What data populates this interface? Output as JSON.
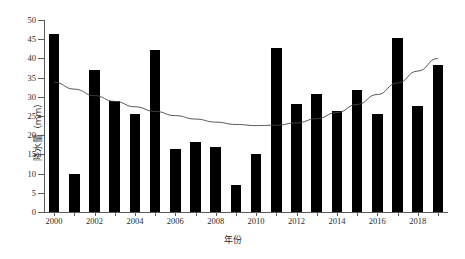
{
  "chart_data": {
    "type": "bar",
    "title": "",
    "xlabel": "年份",
    "ylabel": "降水量（mm）",
    "categories": [
      2000,
      2001,
      2002,
      2003,
      2004,
      2005,
      2006,
      2007,
      2008,
      2009,
      2010,
      2011,
      2012,
      2013,
      2014,
      2015,
      2016,
      2017,
      2018,
      2019
    ],
    "values": [
      46.3,
      9.9,
      37.1,
      28.9,
      25.6,
      42.3,
      16.3,
      18.3,
      17.0,
      7.0,
      15.2,
      42.7,
      28.2,
      30.8,
      26.2,
      31.8,
      25.6,
      45.4,
      27.6,
      38.3
    ],
    "series": [
      {
        "name": "降水量",
        "type": "bar",
        "color": "#000000",
        "values": [
          46.3,
          9.9,
          37.1,
          28.9,
          25.6,
          42.3,
          16.3,
          18.3,
          17.0,
          7.0,
          15.2,
          42.7,
          28.2,
          30.8,
          26.2,
          31.8,
          25.6,
          45.4,
          27.6,
          38.3
        ]
      },
      {
        "name": "趋势线",
        "type": "line",
        "color": "#444444",
        "values": [
          33.8,
          32.0,
          30.3,
          28.8,
          27.4,
          26.2,
          25.1,
          24.2,
          23.4,
          22.8,
          22.5,
          22.6,
          23.2,
          24.3,
          25.9,
          28.0,
          30.6,
          33.6,
          36.7,
          40.0
        ]
      }
    ],
    "ylim": [
      0,
      50
    ],
    "ytick_step": 5,
    "yticks": [
      0,
      5,
      10,
      15,
      20,
      25,
      30,
      35,
      40,
      45,
      50
    ],
    "xticks_labeled": [
      2000,
      2002,
      2004,
      2006,
      2008,
      2010,
      2012,
      2014,
      2016,
      2018
    ],
    "xlim": [
      2000,
      2019
    ],
    "grid": false,
    "legend": false,
    "legend_position": "none",
    "spines": {
      "left": true,
      "bottom": true,
      "top": false,
      "right": false
    },
    "background": "#ffffff"
  }
}
